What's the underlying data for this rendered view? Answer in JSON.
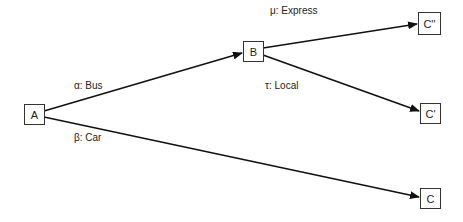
{
  "nodes": {
    "A": {
      "label": "A"
    },
    "B": {
      "label": "B"
    },
    "C2": {
      "label": "C''"
    },
    "C1": {
      "label": "C'"
    },
    "C0": {
      "label": "C"
    }
  },
  "edges": {
    "a_b": {
      "label": "α: Bus"
    },
    "a_c": {
      "label": "β: Car"
    },
    "b_c2": {
      "label": "μ: Express"
    },
    "b_c1": {
      "label": "τ: Local"
    }
  },
  "colors": {
    "stroke": "#111111",
    "node_border": "#333333",
    "text": "#222222",
    "background": "#ffffff"
  }
}
